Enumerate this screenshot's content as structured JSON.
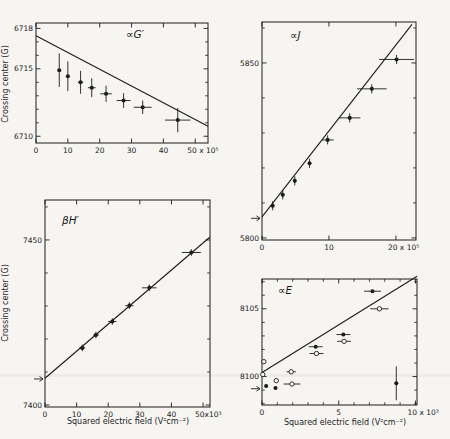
{
  "figure": {
    "background": "#f6f5f2",
    "ink_color": "#1c1c1c"
  },
  "chart_data": {
    "type": "scatter",
    "ylabel": "Crossing center (G)",
    "xlabel": "Squared electric field (V²cm⁻²)",
    "plots": [
      {
        "id": "alpha-G-prime",
        "title": "∝G′",
        "title_offset": [
          90,
          15
        ],
        "frame": {
          "l": 36,
          "t": 23,
          "r": 208,
          "b": 143
        },
        "x": {
          "min": 0,
          "max": 54,
          "minor": [],
          "ticks": [
            {
              "v": 0,
              "label": "0"
            },
            {
              "v": 10,
              "label": "10"
            },
            {
              "v": 20,
              "label": "20"
            },
            {
              "v": 30,
              "label": "30"
            },
            {
              "v": 40,
              "label": "40"
            },
            {
              "v": 50,
              "label": "50 x 10⁵",
              "anchor": "start",
              "dx": -8
            }
          ]
        },
        "y": {
          "min": 6709.5,
          "max": 6718.4,
          "ticks": [
            {
              "v": 6710,
              "label": "6710"
            },
            {
              "v": 6715,
              "label": "6715"
            },
            {
              "v": 6718,
              "label": "6718"
            }
          ],
          "minor": [
            6711,
            6712,
            6713,
            6714,
            6716,
            6717
          ]
        },
        "line": [
          [
            0,
            6717.45
          ],
          [
            54,
            6710.75
          ]
        ],
        "arrow_y": null,
        "ylabel_center": [
          8,
          84
        ],
        "xlabel_center": null,
        "points": [
          {
            "x": 7.3,
            "y": 6714.9,
            "ey": 1.25
          },
          {
            "x": 10.0,
            "y": 6714.45,
            "ey": 1.1
          },
          {
            "x": 14.0,
            "y": 6714.0,
            "ey": 0.85,
            "ex": 0.8
          },
          {
            "x": 17.5,
            "y": 6713.6,
            "ey": 0.7,
            "ex": 1.2
          },
          {
            "x": 22.0,
            "y": 6713.15,
            "ey": 0.6,
            "ex": 1.8
          },
          {
            "x": 27.5,
            "y": 6712.65,
            "ey": 0.55,
            "ex": 2.2
          },
          {
            "x": 33.5,
            "y": 6712.15,
            "ey": 0.5,
            "ex": 2.8
          },
          {
            "x": 44.5,
            "y": 6711.2,
            "ey": 0.9,
            "ex": 4.0
          }
        ],
        "open_points": []
      },
      {
        "id": "alpha-J",
        "title": "∝J",
        "title_offset": [
          28,
          17
        ],
        "frame": {
          "l": 262,
          "t": 22,
          "r": 416,
          "b": 240
        },
        "x": {
          "min": 0,
          "max": 23,
          "minor": [],
          "ticks": [
            {
              "v": 0,
              "label": "0"
            },
            {
              "v": 10,
              "label": "10"
            },
            {
              "v": 20,
              "label": "20 x 10⁵",
              "anchor": "start",
              "dx": -8
            }
          ]
        },
        "y": {
          "min": 5799.4,
          "max": 5861.7,
          "ticks": [
            {
              "v": 5800,
              "label": "5800"
            },
            {
              "v": 5850,
              "label": "5850"
            }
          ],
          "minor": [
            5810,
            5820,
            5830,
            5840,
            5860
          ]
        },
        "line": [
          [
            0,
            5806.0
          ],
          [
            22.4,
            5861.0
          ]
        ],
        "arrow_y": 5805.6,
        "ylabel_center": null,
        "xlabel_center": null,
        "points": [
          {
            "x": 1.6,
            "y": 5809.2,
            "ey": 1.3
          },
          {
            "x": 3.1,
            "y": 5812.3,
            "ey": 1.3
          },
          {
            "x": 4.9,
            "y": 5816.3,
            "ey": 1.3
          },
          {
            "x": 7.1,
            "y": 5821.3,
            "ey": 1.3
          },
          {
            "x": 9.8,
            "y": 5828.0,
            "ey": 1.3,
            "ex": 0.9
          },
          {
            "x": 13.1,
            "y": 5834.3,
            "ey": 1.3,
            "ex": 1.6
          },
          {
            "x": 16.4,
            "y": 5842.6,
            "ey": 1.3,
            "ex": 2.2
          },
          {
            "x": 20.1,
            "y": 5851.0,
            "ey": 1.3,
            "ex": 2.6
          }
        ],
        "open_points": []
      },
      {
        "id": "beta-H-prime",
        "title": "βH′",
        "title_offset": [
          17,
          24
        ],
        "frame": {
          "l": 45,
          "t": 200,
          "r": 210,
          "b": 407
        },
        "x": {
          "min": 0,
          "max": 52.2,
          "minor": [],
          "ticks": [
            {
              "v": 0,
              "label": "0"
            },
            {
              "v": 10,
              "label": "10"
            },
            {
              "v": 20,
              "label": "20"
            },
            {
              "v": 30,
              "label": "30"
            },
            {
              "v": 40,
              "label": "40"
            },
            {
              "v": 50,
              "label": "50x10³",
              "anchor": "start",
              "dx": -8
            }
          ]
        },
        "y": {
          "min": 7399.4,
          "max": 7462.1,
          "ticks": [
            {
              "v": 7400,
              "label": "7400"
            },
            {
              "v": 7450,
              "label": "7450"
            }
          ],
          "minor": [
            7410,
            7420,
            7430,
            7440,
            7460
          ]
        },
        "line": [
          [
            0,
            7408.1
          ],
          [
            52.2,
            7450.9
          ]
        ],
        "arrow_y": 7407.9,
        "ylabel_center": [
          8,
          303
        ],
        "xlabel_center": [
          128,
          424
        ],
        "points": [
          {
            "x": 11.8,
            "y": 7417.3,
            "ey": 1.0,
            "ex": 0.9
          },
          {
            "x": 16.1,
            "y": 7421.2,
            "ey": 1.0,
            "ex": 0.9
          },
          {
            "x": 21.3,
            "y": 7425.3,
            "ey": 1.0,
            "ex": 1.3
          },
          {
            "x": 26.7,
            "y": 7430.1,
            "ey": 1.0,
            "ex": 1.3
          },
          {
            "x": 33.0,
            "y": 7435.5,
            "ey": 1.0,
            "ex": 2.3
          },
          {
            "x": 46.3,
            "y": 7446.2,
            "ey": 1.0,
            "ex": 3.0
          }
        ],
        "open_points": []
      },
      {
        "id": "alpha-E",
        "title": "∝E",
        "title_offset": [
          16,
          15
        ],
        "frame": {
          "l": 262,
          "t": 279,
          "r": 417,
          "b": 405
        },
        "x": {
          "min": 0,
          "max": 10.1,
          "minor": [
            1,
            2,
            3,
            4,
            6,
            7,
            8,
            9
          ],
          "ticks": [
            {
              "v": 0,
              "label": "0"
            },
            {
              "v": 5,
              "label": "5"
            },
            {
              "v": 10,
              "label": "10 x 10³",
              "anchor": "start",
              "dx": -8
            }
          ]
        },
        "y": {
          "min": 8097.9,
          "max": 8107.2,
          "ticks": [
            {
              "v": 8100,
              "label": "8100"
            },
            {
              "v": 8105,
              "label": "8105"
            }
          ],
          "minor": [
            8098,
            8099,
            8101,
            8102,
            8103,
            8104,
            8106,
            8107
          ]
        },
        "line": [
          [
            0,
            8100.3
          ],
          [
            10.1,
            8107.4
          ]
        ],
        "arrow_y": 8099.1,
        "ylabel_center": null,
        "xlabel_center": [
          345,
          425
        ],
        "points": [
          {
            "x": 0.27,
            "y": 8099.3
          },
          {
            "x": 0.88,
            "y": 8099.15
          },
          {
            "x": 3.5,
            "y": 8102.2,
            "ex": 0.45
          },
          {
            "x": 5.3,
            "y": 8103.1,
            "ex": 0.45
          },
          {
            "x": 7.2,
            "y": 8106.3,
            "ex": 0.55
          },
          {
            "x": 8.75,
            "y": 8099.5,
            "ey": 1.25
          }
        ],
        "open_points": [
          {
            "x": 0.05,
            "y": 8100.15
          },
          {
            "x": 0.12,
            "y": 8101.1
          },
          {
            "x": 0.93,
            "y": 8099.7
          },
          {
            "x": 1.9,
            "y": 8100.35,
            "ex": 0.3
          },
          {
            "x": 1.95,
            "y": 8099.45,
            "ex": 0.55
          },
          {
            "x": 3.55,
            "y": 8101.7,
            "ex": 0.45
          },
          {
            "x": 5.35,
            "y": 8102.6,
            "ex": 0.45
          },
          {
            "x": 7.65,
            "y": 8105.0,
            "ex": 0.6
          }
        ]
      }
    ]
  }
}
